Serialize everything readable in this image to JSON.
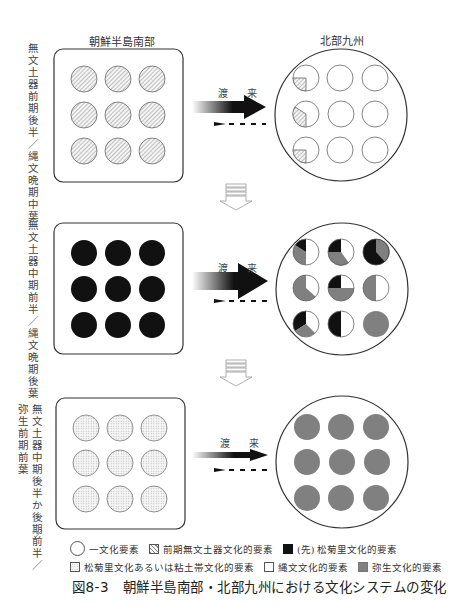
{
  "labels": {
    "korea": "朝鮮半島南部",
    "kyushu": "北部九州",
    "arrival": "渡 来"
  },
  "stages": [
    {
      "period_line1": "無文土器前期後半／縄文晩期中葉",
      "period_line2": "",
      "korea_fill": "hatched",
      "kyushu_cells": [
        [
          "hatched-quarter",
          "empty",
          "empty"
        ],
        [
          "hatched-third",
          "empty",
          "empty"
        ],
        [
          "hatched-quarter",
          "empty",
          "empty"
        ]
      ],
      "arrow_weight": "medium"
    },
    {
      "period_line1": "無文土器中期前半／縄文晩期後葉",
      "period_line2": "",
      "korea_fill": "black",
      "kyushu_cells": [
        [
          "pie: black 12%, gray 38%, white 50%",
          "pie: black 25%, white 15%(top-right) , gray 35%",
          "pie: gray 35%, black 65%"
        ],
        [
          "pie: gray 60%, white 40%",
          "pie: black 25%, white 25%, gray 50%",
          "pie: gray 50%, white 50%"
        ],
        [
          "pie: black 33%, gray 25%, white 42%",
          "pie: black 50%, white 50%",
          "gray"
        ]
      ],
      "arrow_weight": "heavy"
    },
    {
      "period_line1": "無文土器中期後半か後期前半／",
      "period_line2": "弥生前期前葉",
      "korea_fill": "dotted",
      "kyushu_cells": [
        [
          "gray",
          "gray",
          "gray"
        ],
        [
          "gray",
          "gray",
          "gray"
        ],
        [
          "gray",
          "gray",
          "gray"
        ]
      ],
      "arrow_weight": "light"
    }
  ],
  "legend": {
    "row1": [
      {
        "swatch": "circle",
        "label": "一文化要素"
      },
      {
        "swatch": "hatched",
        "label": "前期無文土器文化的要素"
      },
      {
        "swatch": "black",
        "label": "(先) 松菊里文化的要素"
      }
    ],
    "row2": [
      {
        "swatch": "dotted",
        "label": "松菊里文化あるいは粘土帯文化的要素"
      },
      {
        "swatch": "white",
        "label": "縄文文化的要素"
      },
      {
        "swatch": "gray",
        "label": "弥生文化的要素"
      }
    ]
  },
  "caption": "図8-3　朝鮮半島南部・北部九州における文化システムの変化",
  "colors": {
    "black": "#111111",
    "gray": "#808080",
    "outline": "#555555",
    "hatch": "#777777",
    "dot": "#bbbbbb"
  }
}
